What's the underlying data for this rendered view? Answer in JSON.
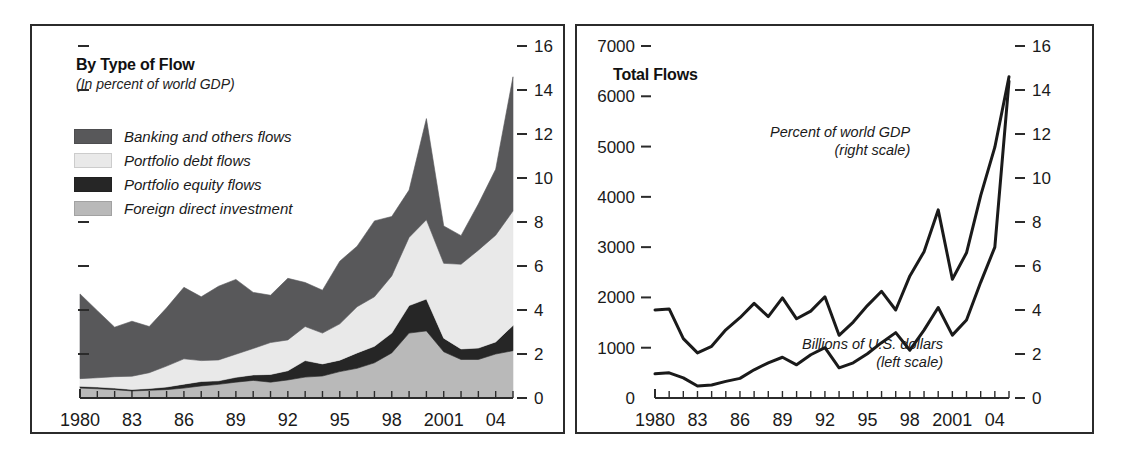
{
  "figure": {
    "background": "#ffffff",
    "frame_color": "#2b2b2b"
  },
  "panels": [
    {
      "id": "left",
      "title": "By Type of Flow",
      "subtitle": "(In percent of world GDP)"
    },
    {
      "id": "right",
      "title": "Total Flows",
      "annotations": [
        {
          "id": "gdp",
          "line1": "Percent of world GDP",
          "line2": "(right scale)"
        },
        {
          "id": "usd",
          "line1": "Billions of U.S. dollars",
          "line2": "(left scale)"
        }
      ]
    }
  ],
  "colors": {
    "banking": "#58585a",
    "portfolio_debt": "#e9e9e9",
    "portfolio_equity": "#262626",
    "fdi": "#b9b9b9",
    "line": "#1a1a1a",
    "axis": "#2b2b2b"
  },
  "chart_data": [
    {
      "type": "area",
      "id": "by-type-of-flow",
      "title": "By Type of Flow",
      "subtitle": "(In percent of world GDP)",
      "stacked": true,
      "xlabel": "",
      "ylabel": "",
      "ylim": [
        0,
        16
      ],
      "yticks": [
        0,
        2,
        4,
        6,
        8,
        10,
        12,
        14,
        16
      ],
      "ytick_labels": [
        "0",
        "2",
        "4",
        "6",
        "8",
        "10",
        "12",
        "14",
        "16"
      ],
      "y_axis_position": "right",
      "grid": false,
      "legend_position": "upper-left",
      "x": [
        1980,
        1981,
        1982,
        1983,
        1984,
        1985,
        1986,
        1987,
        1988,
        1989,
        1990,
        1991,
        1992,
        1993,
        1994,
        1995,
        1996,
        1997,
        1998,
        1999,
        2000,
        2001,
        2002,
        2003,
        2004,
        2005
      ],
      "xtick_labels": [
        "1980",
        "",
        "",
        "83",
        "",
        "",
        "86",
        "",
        "",
        "89",
        "",
        "",
        "92",
        "",
        "",
        "95",
        "",
        "",
        "98",
        "",
        "",
        "2001",
        "",
        "",
        "04",
        ""
      ],
      "series": [
        {
          "name": "Foreign direct investment",
          "color": "#b9b9b9",
          "order": 1,
          "values": [
            0.45,
            0.42,
            0.38,
            0.32,
            0.35,
            0.38,
            0.45,
            0.55,
            0.62,
            0.72,
            0.8,
            0.72,
            0.82,
            0.95,
            1.0,
            1.2,
            1.35,
            1.6,
            2.05,
            2.95,
            3.05,
            2.1,
            1.75,
            1.75,
            2.0,
            2.15
          ]
        },
        {
          "name": "Portfolio equity flows",
          "color": "#262626",
          "order": 2,
          "values": [
            0.08,
            0.08,
            0.07,
            0.07,
            0.08,
            0.12,
            0.18,
            0.2,
            0.16,
            0.22,
            0.25,
            0.35,
            0.42,
            0.75,
            0.55,
            0.52,
            0.7,
            0.75,
            0.9,
            1.25,
            1.45,
            0.62,
            0.48,
            0.52,
            0.55,
            1.15
          ]
        },
        {
          "name": "Portfolio debt flows",
          "color": "#e9e9e9",
          "order": 3,
          "values": [
            0.35,
            0.42,
            0.52,
            0.6,
            0.72,
            0.95,
            1.15,
            0.95,
            0.95,
            1.05,
            1.2,
            1.45,
            1.4,
            1.55,
            1.4,
            1.65,
            2.1,
            2.25,
            2.6,
            3.1,
            3.6,
            3.4,
            3.85,
            4.45,
            4.85,
            5.2
          ]
        },
        {
          "name": "Banking and others flows",
          "color": "#58585a",
          "order": 4,
          "values": [
            3.85,
            3.05,
            2.25,
            2.5,
            2.1,
            2.65,
            3.25,
            2.9,
            3.35,
            3.4,
            2.55,
            2.15,
            2.8,
            2.0,
            1.95,
            2.85,
            2.75,
            3.45,
            2.7,
            2.15,
            4.6,
            1.7,
            1.3,
            2.1,
            3.0,
            6.1
          ]
        }
      ],
      "totals": [
        4.73,
        3.97,
        3.22,
        3.49,
        3.25,
        4.1,
        5.03,
        4.6,
        5.08,
        5.39,
        4.8,
        4.67,
        5.44,
        5.25,
        4.9,
        6.22,
        6.9,
        8.05,
        8.25,
        9.45,
        12.7,
        7.82,
        7.38,
        8.82,
        10.4,
        14.6
      ]
    },
    {
      "type": "line",
      "id": "total-flows",
      "title": "Total Flows",
      "xlabel": "",
      "grid": false,
      "left_axis": {
        "label": "Billions of U.S. dollars",
        "ylim": [
          0,
          7000
        ],
        "yticks": [
          0,
          1000,
          2000,
          3000,
          4000,
          5000,
          6000,
          7000
        ],
        "ytick_labels": [
          "0",
          "1000",
          "2000",
          "3000",
          "4000",
          "5000",
          "6000",
          "7000"
        ]
      },
      "right_axis": {
        "label": "Percent of world GDP",
        "ylim": [
          0,
          16
        ],
        "yticks": [
          0,
          2,
          4,
          6,
          8,
          10,
          12,
          14,
          16
        ],
        "ytick_labels": [
          "0",
          "2",
          "4",
          "6",
          "8",
          "10",
          "12",
          "14",
          "16"
        ]
      },
      "x": [
        1980,
        1981,
        1982,
        1983,
        1984,
        1985,
        1986,
        1987,
        1988,
        1989,
        1990,
        1991,
        1992,
        1993,
        1994,
        1995,
        1996,
        1997,
        1998,
        1999,
        2000,
        2001,
        2002,
        2003,
        2004,
        2005
      ],
      "xtick_labels": [
        "1980",
        "",
        "",
        "83",
        "",
        "",
        "86",
        "",
        "",
        "89",
        "",
        "",
        "92",
        "",
        "",
        "95",
        "",
        "",
        "98",
        "",
        "",
        "2001",
        "",
        "",
        "04",
        ""
      ],
      "series": [
        {
          "name": "Percent of world GDP (right scale)",
          "axis": "right",
          "color": "#1a1a1a",
          "values": [
            4.0,
            4.05,
            2.7,
            2.05,
            2.35,
            3.1,
            3.65,
            4.3,
            3.7,
            4.55,
            3.6,
            3.95,
            4.6,
            2.85,
            3.45,
            4.2,
            4.85,
            4.0,
            5.55,
            6.65,
            8.55,
            5.4,
            6.6,
            9.2,
            11.4,
            14.6
          ]
        },
        {
          "name": "Billions of U.S. dollars (left scale)",
          "axis": "left",
          "color": "#1a1a1a",
          "values": [
            480,
            500,
            400,
            240,
            260,
            330,
            390,
            560,
            700,
            810,
            660,
            860,
            1000,
            600,
            700,
            880,
            1100,
            1300,
            950,
            1350,
            1800,
            1250,
            1550,
            2300,
            3000,
            6300
          ]
        }
      ]
    }
  ]
}
